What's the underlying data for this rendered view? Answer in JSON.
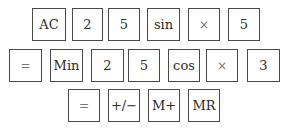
{
  "rows": [
    {
      "keys": [
        {
          "label": "AC"
        },
        {
          "label": "2"
        },
        {
          "label": "5"
        },
        {
          "label": "sin"
        },
        {
          "label": "×"
        },
        {
          "label": "5"
        }
      ]
    },
    {
      "keys": [
        {
          "label": "="
        },
        {
          "label": "Min"
        },
        {
          "label": "2"
        },
        {
          "label": "5"
        },
        {
          "label": "cos"
        },
        {
          "label": "×"
        },
        {
          "label": "3"
        }
      ]
    },
    {
      "keys": [
        {
          "label": "="
        },
        {
          "label": "+/−"
        },
        {
          "label": "M+"
        },
        {
          "label": "MR"
        }
      ]
    }
  ]
}
